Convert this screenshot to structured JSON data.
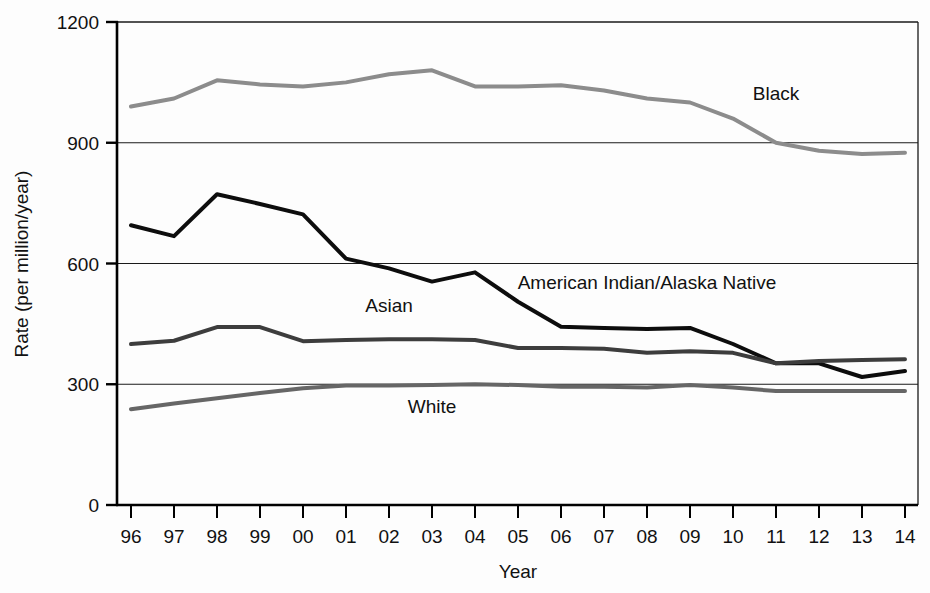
{
  "chart_data": {
    "type": "line",
    "title": "",
    "subtitle": "",
    "xlabel": "Year",
    "ylabel": "Rate (per million/year)",
    "x": [
      "96",
      "97",
      "98",
      "99",
      "00",
      "01",
      "02",
      "03",
      "04",
      "05",
      "06",
      "07",
      "08",
      "09",
      "10",
      "11",
      "12",
      "13",
      "14"
    ],
    "xtick_labels": [
      "96",
      "97",
      "98",
      "99",
      "00",
      "01",
      "02",
      "03",
      "04",
      "05",
      "06",
      "07",
      "08",
      "09",
      "10",
      "11",
      "12",
      "13",
      "14"
    ],
    "ytick_labels": [
      "0",
      "300",
      "600",
      "900",
      "1200"
    ],
    "ytick_values": [
      0,
      300,
      600,
      900,
      1200
    ],
    "ylim": [
      0,
      1200
    ],
    "xlim_labels": [
      "96",
      "14"
    ],
    "grid": "horizontal",
    "gridlines_at": [
      300,
      600,
      900
    ],
    "legend_position": "inline-annotations",
    "series": [
      {
        "name": "Black",
        "label": "Black",
        "color": "#8c8c8c",
        "linewidth": 4,
        "values": [
          990,
          1010,
          1055,
          1045,
          1040,
          1050,
          1070,
          1080,
          1040,
          1040,
          1043,
          1030,
          1010,
          1000,
          960,
          900,
          880,
          872,
          875
        ]
      },
      {
        "name": "American Indian/Alaska Native",
        "label": "American Indian/Alaska Native",
        "color": "#0d0d0d",
        "linewidth": 4,
        "values": [
          695,
          668,
          772,
          748,
          722,
          612,
          588,
          555,
          578,
          505,
          443,
          440,
          437,
          440,
          400,
          352,
          352,
          318,
          333
        ]
      },
      {
        "name": "Asian",
        "label": "Asian",
        "color": "#3d3d3d",
        "linewidth": 4,
        "values": [
          400,
          408,
          442,
          442,
          407,
          410,
          412,
          412,
          410,
          390,
          390,
          388,
          378,
          382,
          378,
          352,
          358,
          360,
          362
        ]
      },
      {
        "name": "White",
        "label": "White",
        "color": "#666666",
        "linewidth": 4,
        "values": [
          238,
          252,
          265,
          278,
          290,
          297,
          297,
          298,
          300,
          298,
          294,
          294,
          292,
          298,
          292,
          283,
          283,
          283,
          283
        ]
      }
    ],
    "annotations": [
      {
        "text": "Black",
        "x_label": "11",
        "y_value": 1005,
        "series": "Black"
      },
      {
        "text": "American Indian/Alaska Native",
        "x_label": "08",
        "y_value": 537,
        "series": "American Indian/Alaska Native"
      },
      {
        "text": "Asian",
        "x_label": "02",
        "y_value": 480,
        "series": "Asian"
      },
      {
        "text": "White",
        "x_label": "03",
        "y_value": 228,
        "series": "White"
      }
    ]
  }
}
